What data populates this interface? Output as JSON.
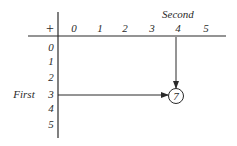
{
  "table": {
    "operator": "+",
    "column_axis_label": "Second",
    "row_axis_label": "First",
    "columns": [
      "0",
      "1",
      "2",
      "3",
      "4",
      "5"
    ],
    "rows": [
      "0",
      "1",
      "2",
      "3",
      "4",
      "5"
    ],
    "highlight": {
      "row": "3",
      "column": "4",
      "result": "7"
    }
  },
  "colors": {
    "ink": "#2a2a2a",
    "background": "#ffffff"
  }
}
